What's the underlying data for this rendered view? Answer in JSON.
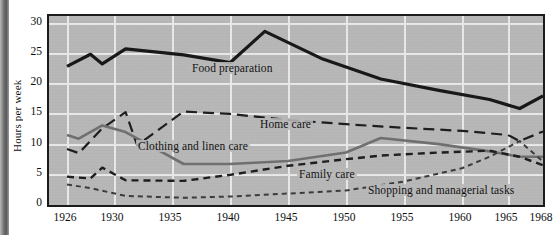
{
  "chart_data": {
    "type": "line",
    "title": "",
    "xlabel": "",
    "ylabel": "Hours per week",
    "ylim": [
      0,
      32
    ],
    "xlim": [
      1926,
      1969
    ],
    "grid": true,
    "legend_position": "inline-annotations",
    "y_ticks": [
      0,
      5,
      10,
      15,
      20,
      25,
      30
    ],
    "x_ticks": [
      1926,
      1930,
      1935,
      1940,
      1945,
      1950,
      1955,
      1960,
      1965,
      1968
    ],
    "x_tick_labels": [
      "1926",
      "1930",
      "1935",
      "1940",
      "1945",
      "1950",
      "1955",
      "1960",
      "1965",
      "1968"
    ],
    "y_tick_labels": [
      "0",
      "5",
      "10",
      "15",
      "20",
      "25",
      "30"
    ],
    "series": [
      {
        "name": "Food preparation",
        "style": "solid-thick-black",
        "color": "#161616",
        "x": [
          1926,
          1928,
          1929,
          1931,
          1936,
          1940,
          1943,
          1948,
          1953,
          1958,
          1963,
          1966,
          1968
        ],
        "values": [
          22.8,
          24.8,
          23.2,
          25.7,
          24.7,
          23.4,
          28.6,
          24.0,
          20.7,
          18.8,
          17.3,
          15.8,
          17.9
        ]
      },
      {
        "name": "Home care",
        "style": "long-dash-black",
        "color": "#1c1c1c",
        "x": [
          1926,
          1927,
          1929,
          1931,
          1932,
          1936,
          1940,
          1945,
          1950,
          1955,
          1960,
          1965,
          1966,
          1968
        ],
        "values": [
          9.1,
          8.4,
          12.5,
          15.2,
          9.7,
          15.3,
          14.9,
          13.9,
          13.2,
          12.6,
          12.1,
          11.4,
          10.4,
          12.0
        ]
      },
      {
        "name": "Clothing and linen care",
        "style": "solid-medium-gray",
        "color": "#6f6f6f",
        "x": [
          1926,
          1927,
          1929,
          1931,
          1936,
          1940,
          1945,
          1950,
          1953,
          1958,
          1963,
          1966,
          1968
        ],
        "values": [
          11.4,
          10.8,
          13.0,
          11.9,
          6.6,
          6.6,
          7.1,
          8.5,
          10.9,
          9.9,
          8.7,
          7.8,
          7.8
        ]
      },
      {
        "name": "Family care",
        "style": "medium-dash-black",
        "color": "#1c1c1c",
        "x": [
          1926,
          1928,
          1929,
          1931,
          1936,
          1940,
          1945,
          1950,
          1953,
          1958,
          1963,
          1966,
          1968
        ],
        "values": [
          4.5,
          4.2,
          6.0,
          3.9,
          3.8,
          4.8,
          6.3,
          7.4,
          8.0,
          8.5,
          8.8,
          7.8,
          6.4
        ]
      },
      {
        "name": "Shopping and managerial tasks",
        "style": "short-dash-gray",
        "color": "#3a3a3a",
        "x": [
          1926,
          1928,
          1931,
          1936,
          1940,
          1945,
          1950,
          1955,
          1960,
          1963,
          1966,
          1968
        ],
        "values": [
          3.2,
          2.6,
          1.3,
          1.0,
          1.2,
          1.7,
          2.2,
          3.7,
          5.9,
          7.8,
          10.4,
          7.0
        ]
      }
    ],
    "annotations": [
      {
        "text": "Food preparation",
        "series": "Food preparation"
      },
      {
        "text": "Home care",
        "series": "Home care"
      },
      {
        "text": "Clothing and linen care",
        "series": "Clothing and linen care"
      },
      {
        "text": "Family care",
        "series": "Family care"
      },
      {
        "text": "Shopping and managerial tasks",
        "series": "Shopping and managerial tasks"
      }
    ]
  },
  "axis": {
    "y_title": "Hours per week",
    "y_labels": [
      "30",
      "25",
      "20",
      "15",
      "10",
      "5",
      "0"
    ],
    "x_labels": [
      "1926",
      "1930",
      "1935",
      "1940",
      "1945",
      "1950",
      "1955",
      "1960",
      "1965",
      "1968"
    ]
  },
  "labels": {
    "food_preparation": "Food preparation",
    "home_care": "Home care",
    "clothing_and_linen_care": "Clothing and linen care",
    "family_care": "Family care",
    "shopping_and_managerial_tasks": "Shopping and managerial tasks"
  },
  "colors": {
    "plot_background": "#b7b7b7",
    "grid": "#e9e9e9",
    "frame": "#1b1b1b",
    "food_preparation": "#161616",
    "home_care": "#1c1c1c",
    "clothing_and_linen_care": "#6f6f6f",
    "family_care": "#1c1c1c",
    "shopping_and_managerial_tasks": "#3a3a3a"
  }
}
